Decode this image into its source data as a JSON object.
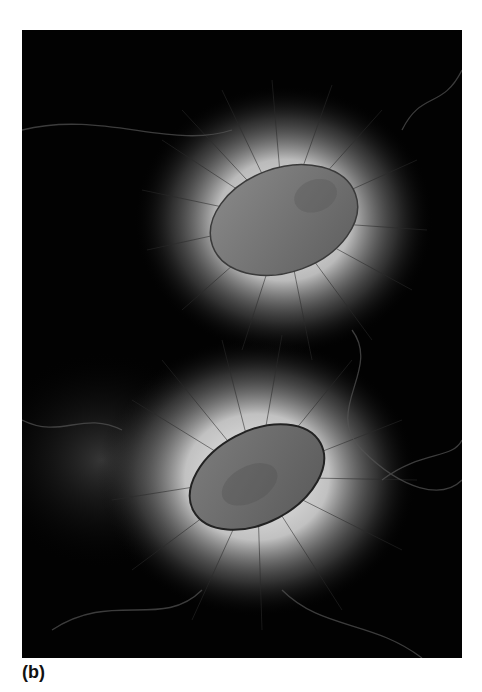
{
  "figure": {
    "panel_label": "(b)",
    "colors": {
      "background": "#020202",
      "halo": "#e8e8e8",
      "cell_body": "#6f6f6f",
      "filament": "#2a2a2a"
    }
  }
}
